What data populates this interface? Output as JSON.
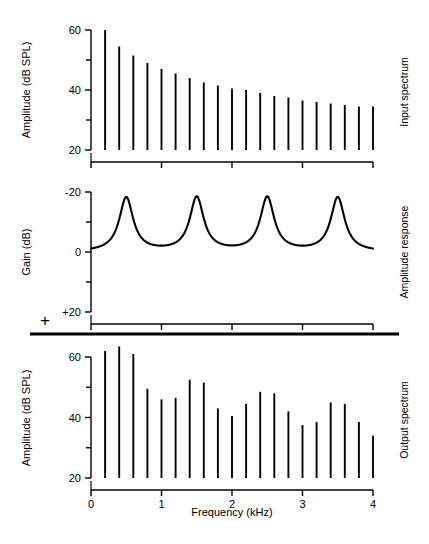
{
  "figure": {
    "xlabel": "Frequency (kHz)",
    "x_ticks": [
      "0",
      "1",
      "2",
      "3",
      "4"
    ],
    "plus_symbol": "+"
  },
  "panels": {
    "input": {
      "side_label": "Input spectrum",
      "ylabel": "Amplitude (dB SPL)",
      "y_ticks": [
        "20",
        "40",
        "60"
      ]
    },
    "response": {
      "side_label": "Amplitude response",
      "ylabel": "Gain (dB)",
      "y_ticks": [
        "+20",
        "0",
        "-20"
      ]
    },
    "output": {
      "side_label": "Output spectrum",
      "ylabel": "Amplitude (dB SPL)",
      "y_ticks": [
        "20",
        "40",
        "60"
      ]
    }
  },
  "chart_data": [
    {
      "type": "bar",
      "title": "Input spectrum",
      "xlabel": "Frequency (kHz)",
      "ylabel": "Amplitude (dB SPL)",
      "xlim": [
        0,
        4
      ],
      "ylim": [
        20,
        60
      ],
      "grid": false,
      "baseline": 20,
      "x": [
        0.2,
        0.4,
        0.6,
        0.8,
        1.0,
        1.2,
        1.4,
        1.6,
        1.8,
        2.0,
        2.2,
        2.4,
        2.6,
        2.8,
        3.0,
        3.2,
        3.4,
        3.6,
        3.8,
        4.0
      ],
      "values": [
        60,
        54.5,
        51.5,
        49,
        47,
        45.5,
        44,
        42.5,
        41.5,
        40.5,
        40,
        39,
        38,
        37.5,
        36.5,
        36,
        35.5,
        35,
        34.5,
        34.5
      ]
    },
    {
      "type": "line",
      "title": "Amplitude response",
      "xlabel": "Frequency (kHz)",
      "ylabel": "Gain (dB)",
      "xlim": [
        0,
        4
      ],
      "ylim": [
        -20,
        20
      ],
      "grid": false,
      "peak_frequencies": [
        0.5,
        1.5,
        2.5,
        3.5
      ],
      "peak_gain": 18,
      "baseline_gain": 0,
      "peak_halfwidth": 0.12
    },
    {
      "type": "bar",
      "title": "Output spectrum",
      "xlabel": "Frequency (kHz)",
      "ylabel": "Amplitude (dB SPL)",
      "xlim": [
        0,
        4
      ],
      "ylim": [
        20,
        60
      ],
      "grid": false,
      "baseline": 20,
      "x": [
        0.2,
        0.4,
        0.6,
        0.8,
        1.0,
        1.2,
        1.4,
        1.6,
        1.8,
        2.0,
        2.2,
        2.4,
        2.6,
        2.8,
        3.0,
        3.2,
        3.4,
        3.6,
        3.8,
        4.0
      ],
      "values": [
        62,
        63.5,
        61,
        49.5,
        46,
        46.5,
        52.5,
        51.5,
        43,
        40.5,
        44.5,
        48.5,
        48,
        42,
        37.5,
        38.5,
        45,
        44.5,
        38.5,
        34
      ]
    }
  ]
}
